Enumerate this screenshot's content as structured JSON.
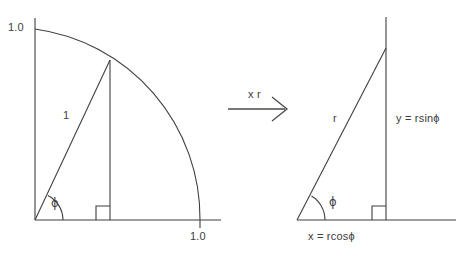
{
  "figure": {
    "background_color": "#ffffff",
    "line_color": "#3f3f3f",
    "text_color": "#3d3d3d"
  },
  "left_panel": {
    "name": "unit-circle-quadrant",
    "y_axis_label": "1.0",
    "x_axis_label": "1.0",
    "hypotenuse_label": "1",
    "angle_label": "ϕ",
    "radius": 1.0,
    "angle_degrees": 57,
    "geometry": {
      "origin": [
        35,
        220
      ],
      "y_axis_top": [
        35,
        18
      ],
      "arc_start": [
        35,
        29
      ],
      "arc_end": [
        200,
        220
      ],
      "arc_radius": 191,
      "point_on_circle": [
        110,
        60
      ],
      "x_axis_end": [
        220,
        220
      ],
      "right_angle_square_size": 14
    }
  },
  "transform_arrow": {
    "name": "scale-arrow",
    "label": "x r",
    "from": [
      228,
      108
    ],
    "to": [
      288,
      108
    ]
  },
  "right_panel": {
    "name": "scaled-right-triangle",
    "hypotenuse_label": "r",
    "vertical_label": "y = rsinϕ",
    "horizontal_label": "x = rcosϕ",
    "angle_label": "ϕ",
    "geometry": {
      "origin": [
        297,
        220
      ],
      "apex": [
        386,
        48
      ],
      "vertical_top": [
        386,
        17
      ],
      "foot": [
        386,
        220
      ],
      "x_axis_end": [
        455,
        220
      ],
      "right_angle_square_size": 14
    }
  }
}
